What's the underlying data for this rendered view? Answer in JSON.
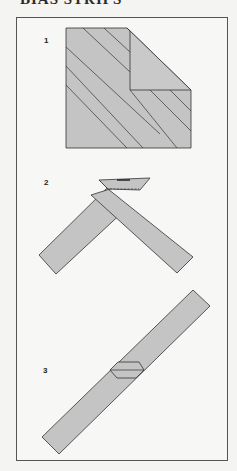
{
  "title": "BIAS STRIPS",
  "steps": [
    {
      "label": "1",
      "description": "Square of fabric folded diagonally with bias lines marked"
    },
    {
      "label": "2",
      "description": "Two bias strips joined at right angles with seam line"
    },
    {
      "label": "3",
      "description": "Joined bias strip pressed open showing seam"
    }
  ],
  "colors": {
    "fabric": "#c4c4c4",
    "outline": "#333333",
    "background": "#f7f7f5"
  }
}
